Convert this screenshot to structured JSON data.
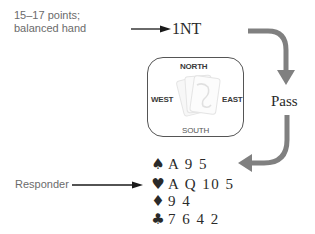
{
  "annotations": {
    "opener_line1": "15–17 points;",
    "opener_line2": "balanced hand",
    "responder": "Responder"
  },
  "bids": {
    "opener": "1NT",
    "next": "Pass"
  },
  "table": {
    "north": "NORTH",
    "south": "SOUTH",
    "east": "EAST",
    "west": "WEST",
    "center_icon": "card-deck-icon"
  },
  "hand": [
    {
      "suit": "spades",
      "symbol": "♠",
      "cards": "A 9 5"
    },
    {
      "suit": "hearts",
      "symbol": "♥",
      "cards": "A Q 10 5"
    },
    {
      "suit": "diamonds",
      "symbol": "♦",
      "cards": "9 4"
    },
    {
      "suit": "clubs",
      "symbol": "♣",
      "cards": "7 6 4 2"
    }
  ],
  "colors": {
    "arrow_black": "#1a1a1a",
    "arrow_gray": "#808080",
    "label_gray": "#6b6b6b",
    "text_dark": "#2a2a2a"
  }
}
